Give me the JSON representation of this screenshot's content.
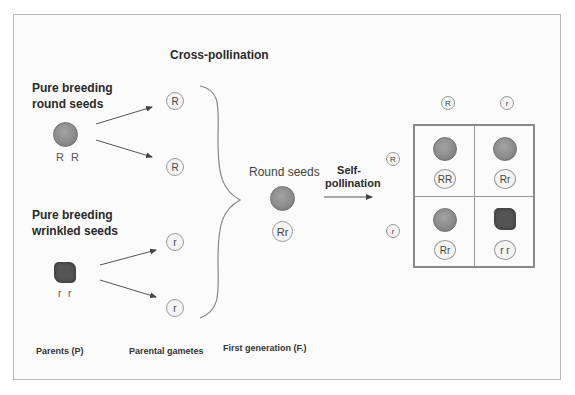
{
  "title": "Cross-pollination",
  "parents": {
    "round": {
      "label_line1": "Pure breeding",
      "label_line2": "round seeds",
      "genotype": "R R"
    },
    "wrinkled": {
      "label_line1": "Pure breeding",
      "label_line2": "wrinkled seeds",
      "genotype": "r r"
    }
  },
  "gametes": [
    "R",
    "R",
    "r",
    "r"
  ],
  "first_generation": {
    "label": "Round seeds",
    "genotype": "Rr"
  },
  "self_pollination": {
    "line1": "Self-",
    "line2": "pollination"
  },
  "punnett": {
    "column_headers": [
      "R",
      "r"
    ],
    "row_headers": [
      "R",
      "r"
    ],
    "cells": [
      {
        "genotype": "RR",
        "phenotype": "round"
      },
      {
        "genotype": "Rr",
        "phenotype": "round"
      },
      {
        "genotype": "Rr",
        "phenotype": "round"
      },
      {
        "genotype": "r r",
        "phenotype": "wrinkled"
      }
    ]
  },
  "bottom_labels": {
    "parents": "Parents (P)",
    "gametes": "Parental gametes",
    "first_gen": "First generation (F.)"
  },
  "colors": {
    "seed_round": "#8a8a8a",
    "seed_wrinkled": "#555555",
    "border": "#b8b8b8",
    "arrow": "#444444"
  }
}
